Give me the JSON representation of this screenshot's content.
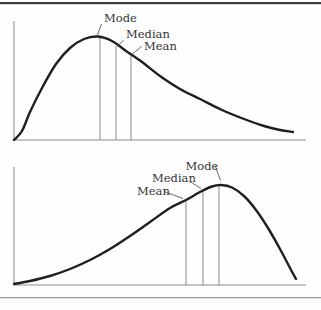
{
  "page": {
    "background": "#fefefe",
    "top_rule_color": "#3f3f3f",
    "bottom_rule_color": "#9c9c9c"
  },
  "chart_data": [
    {
      "name": "right-skewed-distribution",
      "type": "line",
      "skew": "positive",
      "grid": false,
      "legend": false,
      "style": {
        "curve_color": "#1f1f1f",
        "axis_color": "#8c8c8c",
        "marker_color": "#8a8a8a",
        "leader_color": "#5a5a5a",
        "label_color": "#343434",
        "curve_width": 2.4,
        "font_size": 11.5
      },
      "y_axis": {
        "x": 14,
        "y1": 21,
        "y2": 140
      },
      "x_axis": {
        "y": 140,
        "x1": 14,
        "x2": 306
      },
      "curve_points": [
        [
          14,
          140
        ],
        [
          22,
          131
        ],
        [
          30,
          112
        ],
        [
          42,
          88
        ],
        [
          56,
          64
        ],
        [
          70,
          48
        ],
        [
          84,
          39
        ],
        [
          98,
          36.5
        ],
        [
          112,
          41
        ],
        [
          126,
          51
        ],
        [
          142,
          62
        ],
        [
          160,
          76
        ],
        [
          180,
          89
        ],
        [
          200,
          99
        ],
        [
          222,
          110
        ],
        [
          244,
          119
        ],
        [
          264,
          126
        ],
        [
          280,
          130
        ],
        [
          293,
          132
        ]
      ],
      "markers": [
        {
          "label": "Mode",
          "x": 100,
          "y_top": 37
        },
        {
          "label": "Median",
          "x": 116,
          "y_top": 46
        },
        {
          "label": "Mean",
          "x": 131,
          "y_top": 56
        }
      ],
      "labels": [
        {
          "key": "mode",
          "text": "Mode",
          "x": 104,
          "y": 22,
          "leader": [
            [
              101.5,
              24
            ],
            [
              97.5,
              35
            ]
          ]
        },
        {
          "key": "median",
          "text": "Median",
          "x": 126,
          "y": 38,
          "leader": [
            [
              123.5,
              40
            ],
            [
              117.5,
              46.5
            ]
          ]
        },
        {
          "key": "mean",
          "text": "Mean",
          "x": 144,
          "y": 50,
          "leader": [
            [
              141.5,
              46.5
            ],
            [
              130.5,
              55.5
            ]
          ]
        }
      ]
    },
    {
      "name": "left-skewed-distribution",
      "type": "line",
      "skew": "negative",
      "grid": false,
      "legend": false,
      "style": {
        "curve_color": "#1f1f1f",
        "axis_color": "#8c8c8c",
        "marker_color": "#8a8a8a",
        "leader_color": "#5a5a5a",
        "label_color": "#343434",
        "curve_width": 2.4,
        "font_size": 11.5
      },
      "y_axis": {
        "x": 14,
        "y1": 167,
        "y2": 285
      },
      "x_axis": {
        "y": 285,
        "x1": 14,
        "x2": 306
      },
      "curve_points": [
        [
          14,
          284
        ],
        [
          30,
          281
        ],
        [
          50,
          276
        ],
        [
          70,
          269
        ],
        [
          90,
          260
        ],
        [
          110,
          249
        ],
        [
          130,
          236
        ],
        [
          150,
          222
        ],
        [
          170,
          208
        ],
        [
          186,
          200
        ],
        [
          200,
          192
        ],
        [
          212,
          186.5
        ],
        [
          221,
          185
        ],
        [
          232,
          187.5
        ],
        [
          244,
          196
        ],
        [
          256,
          210
        ],
        [
          268,
          228
        ],
        [
          280,
          249
        ],
        [
          290,
          268
        ],
        [
          296,
          279
        ]
      ],
      "markers": [
        {
          "label": "Mean",
          "x": 186,
          "y_top": 200
        },
        {
          "label": "Median",
          "x": 203,
          "y_top": 191
        },
        {
          "label": "Mode",
          "x": 219,
          "y_top": 185
        }
      ],
      "labels": [
        {
          "key": "mode",
          "text": "Mode",
          "x": 185.5,
          "y": 170,
          "leader": [
            [
              215,
              165.5
            ],
            [
              220.5,
              180.5
            ]
          ]
        },
        {
          "key": "median",
          "text": "Median",
          "x": 152,
          "y": 182,
          "leader": [
            [
              190,
              181.5
            ],
            [
              201,
              188.5
            ]
          ]
        },
        {
          "key": "mean",
          "text": "Mean",
          "x": 137,
          "y": 195,
          "leader": [
            [
              164,
              191.5
            ],
            [
              183,
              198.5
            ]
          ]
        }
      ]
    }
  ]
}
